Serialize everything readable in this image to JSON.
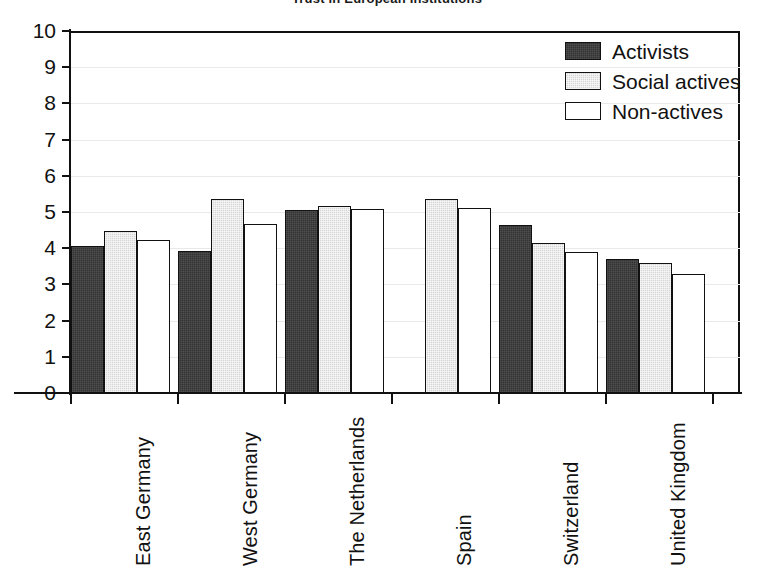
{
  "chart_data": {
    "type": "bar",
    "title": "Trust in European Institutions",
    "xlabel": "",
    "ylabel": "",
    "ylim": [
      0,
      10
    ],
    "yticks": [
      0,
      1,
      2,
      3,
      4,
      5,
      6,
      7,
      8,
      9,
      10
    ],
    "ytick_labels": [
      "0",
      "1",
      "2",
      "3",
      "4",
      "5",
      "6",
      "7",
      "8",
      "9",
      "10"
    ],
    "grid": true,
    "legend_position": "top-right",
    "categories": [
      "East Germany",
      "West Germany",
      "The Netherlands",
      "Spain",
      "Switzerland",
      "United Kingdom"
    ],
    "series": [
      {
        "name": "Activists",
        "color": "#333333",
        "values": [
          4.05,
          3.93,
          5.05,
          null,
          4.65,
          3.71
        ]
      },
      {
        "name": "Social actives",
        "color": "#d6d6d6",
        "values": [
          4.48,
          5.37,
          5.17,
          5.35,
          4.13,
          3.6
        ]
      },
      {
        "name": "Non-actives",
        "color": "#ffffff",
        "values": [
          4.24,
          4.66,
          5.08,
          5.12,
          3.9,
          3.29
        ]
      }
    ]
  },
  "legend": {
    "items": [
      {
        "label": "Activists",
        "swatch": "dark-hatched-swatch"
      },
      {
        "label": "Social actives",
        "swatch": "light-hatched-swatch"
      },
      {
        "label": "Non-actives",
        "swatch": "white-swatch"
      }
    ]
  }
}
